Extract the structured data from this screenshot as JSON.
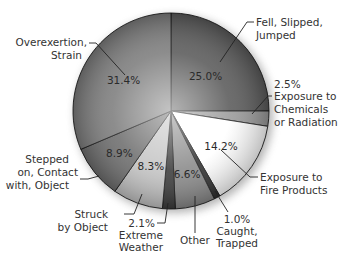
{
  "chart_data": {
    "type": "pie",
    "title": "",
    "start_angle_deg": 0,
    "direction": "clockwise",
    "unit": "%",
    "slices": [
      {
        "label": "Fell, Slipped, Jumped",
        "value": 25.0,
        "display": "25.0%",
        "color": "#5a5a5a"
      },
      {
        "label": "Exposure to Chemicals or Radiation",
        "value": 2.5,
        "display": "2.5%",
        "color": "#9a9a9a"
      },
      {
        "label": "Exposure to Fire Products",
        "value": 14.2,
        "display": "14.2%",
        "color": "#ffffff"
      },
      {
        "label": "Caught, Trapped",
        "value": 1.0,
        "display": "1.0%",
        "color": "#303030"
      },
      {
        "label": "Other",
        "value": 6.6,
        "display": "6.6%",
        "color": "#8a8a8a"
      },
      {
        "label": "Extreme Weather",
        "value": 2.1,
        "display": "2.1%",
        "color": "#3c3c3c"
      },
      {
        "label": "Struck by Object",
        "value": 8.3,
        "display": "8.3%",
        "color": "#c4c4c4"
      },
      {
        "label": "Stepped on, Contact with, Object",
        "value": 8.9,
        "display": "8.9%",
        "color": "#6e6e6e"
      },
      {
        "label": "Overexertion, Strain",
        "value": 31.4,
        "display": "31.4%",
        "color": "#7d7d7d"
      }
    ],
    "legend": "none (callout labels with leader lines)"
  },
  "labels": {
    "fell": [
      "Fell, Slipped,",
      "Jumped"
    ],
    "chem_pct": "2.5%",
    "chem": [
      "Exposure to",
      "Chemicals",
      "or Radiation"
    ],
    "fire": [
      "Exposure to",
      "Fire Products"
    ],
    "caught_pct": "1.0%",
    "caught": [
      "Caught,",
      "Trapped"
    ],
    "other": "Other",
    "weather_pct": "2.1%",
    "weather": [
      "Extreme",
      "Weather"
    ],
    "struck": [
      "Struck",
      "by Object"
    ],
    "stepped": [
      "Stepped",
      "on, Contact",
      "with, Object"
    ],
    "over": [
      "Overexertion,",
      "Strain"
    ]
  }
}
